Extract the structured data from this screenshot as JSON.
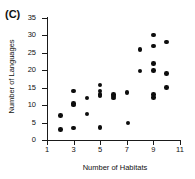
{
  "panel": {
    "label": "(C)"
  },
  "chart_data": {
    "type": "scatter",
    "title": "(C)",
    "xlabel": "Number of Habitats",
    "ylabel": "Number of Languages",
    "xlim": [
      1,
      11
    ],
    "ylim": [
      0,
      35
    ],
    "xticks": [
      1,
      3,
      5,
      7,
      9,
      11
    ],
    "yticks": [
      0,
      5,
      10,
      15,
      20,
      25,
      30,
      35
    ],
    "grid": false,
    "legend": null,
    "marker": "filled-circle",
    "marker_color": "#0d0d0d",
    "points": [
      {
        "x": 2,
        "y": 7
      },
      {
        "x": 2,
        "y": 3
      },
      {
        "x": 3,
        "y": 14
      },
      {
        "x": 3,
        "y": 10.5
      },
      {
        "x": 3,
        "y": 10
      },
      {
        "x": 3,
        "y": 3.5
      },
      {
        "x": 4,
        "y": 12
      },
      {
        "x": 4,
        "y": 7.5
      },
      {
        "x": 5,
        "y": 15.8
      },
      {
        "x": 5,
        "y": 14
      },
      {
        "x": 5,
        "y": 13
      },
      {
        "x": 5,
        "y": 12.6
      },
      {
        "x": 5,
        "y": 3.6
      },
      {
        "x": 6,
        "y": 13
      },
      {
        "x": 6,
        "y": 12.6
      },
      {
        "x": 6,
        "y": 12
      },
      {
        "x": 7,
        "y": 13.6
      },
      {
        "x": 7.1,
        "y": 4.9
      },
      {
        "x": 8,
        "y": 26
      },
      {
        "x": 8,
        "y": 19.8
      },
      {
        "x": 9,
        "y": 30.1
      },
      {
        "x": 9,
        "y": 27
      },
      {
        "x": 9,
        "y": 22
      },
      {
        "x": 9,
        "y": 20
      },
      {
        "x": 9,
        "y": 13
      },
      {
        "x": 9,
        "y": 12.2
      },
      {
        "x": 10,
        "y": 28.1
      },
      {
        "x": 10,
        "y": 19
      },
      {
        "x": 10,
        "y": 15
      }
    ]
  }
}
